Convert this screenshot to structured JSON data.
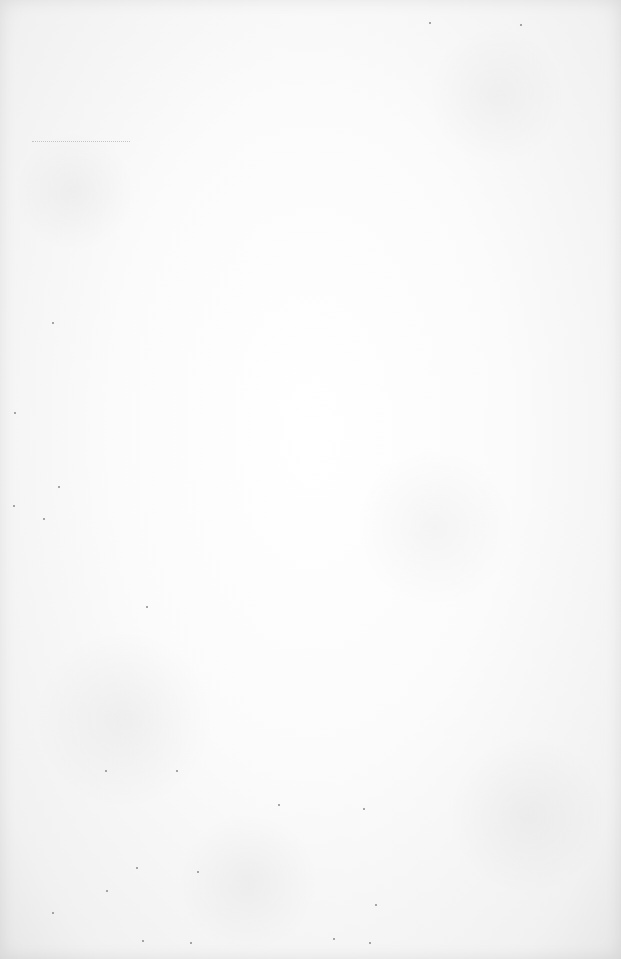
{
  "page": {
    "type": "blank-scanned-page",
    "text": ""
  },
  "colors": {
    "paper": "#fbfbfb",
    "edge": "#e6e6e6",
    "speck": "#8a8a8a"
  }
}
